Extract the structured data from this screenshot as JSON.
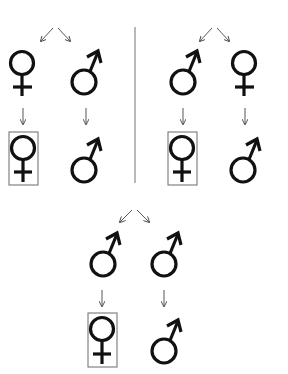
{
  "diagram": {
    "title": "",
    "colors": {
      "symbol": "#111111",
      "arrow": "#444444",
      "box": "#777777",
      "divider": "#8a8a8a",
      "background": "#ffffff"
    },
    "panels": [
      {
        "id": "top-left",
        "parents": [
          "female",
          "male"
        ],
        "offspring": [
          "female",
          "male"
        ],
        "highlighted_offspring": "female"
      },
      {
        "id": "top-right",
        "parents": [
          "male",
          "female"
        ],
        "offspring": [
          "female",
          "male"
        ],
        "highlighted_offspring": "female"
      },
      {
        "id": "bottom",
        "parents": [
          "male",
          "male"
        ],
        "offspring": [
          "female",
          "male"
        ],
        "highlighted_offspring": "female"
      }
    ],
    "icons": {
      "female": "female-symbol-icon (♀)",
      "male": "male-symbol-icon (♂)",
      "arrow": "arrow-icon"
    }
  }
}
